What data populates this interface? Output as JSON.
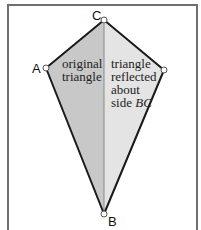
{
  "figure": {
    "points": {
      "A": {
        "label": "A",
        "x": 46,
        "y": 68
      },
      "B": {
        "label": "B",
        "x": 104,
        "y": 214
      },
      "C": {
        "label": "C",
        "x": 104,
        "y": 20
      },
      "D": {
        "label": "",
        "x": 164,
        "y": 70
      }
    },
    "regions": {
      "left": {
        "lines": [
          "original",
          "triangle"
        ],
        "fill": "#c8c8c8"
      },
      "right": {
        "lines": [
          "triangle",
          "reflected",
          "about",
          "side "
        ],
        "italic_suffix": "BC",
        "fill": "#e3e3e3"
      }
    },
    "colors": {
      "edge": "#1a1a1a",
      "axis": "#8a8a8a",
      "frame": "#6f6f6f"
    }
  }
}
